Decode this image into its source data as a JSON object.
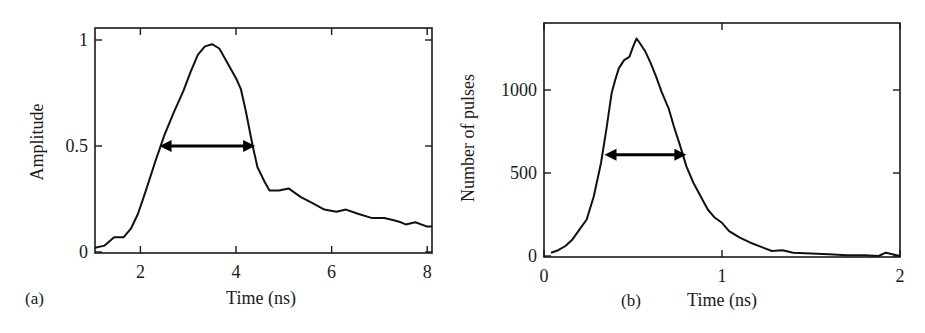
{
  "chart_data": [
    {
      "type": "line",
      "panel_label": "(a)",
      "title": "",
      "xlabel": "Time (ns)",
      "ylabel": "Amplitude",
      "xlim": [
        1.05,
        8.1
      ],
      "ylim": [
        0,
        1.05
      ],
      "xticks": [
        2,
        4,
        6,
        8
      ],
      "xtick_labels": [
        "2",
        "4",
        "6",
        "8"
      ],
      "yticks": [
        0,
        0.5,
        1
      ],
      "ytick_labels": [
        "0",
        "0.5",
        "1"
      ],
      "grid": false,
      "legend": null,
      "annotations": [
        {
          "type": "double-arrow",
          "label": "FWHM",
          "x_start": 2.4,
          "x_end": 4.4,
          "y": 0.5
        }
      ],
      "series": [
        {
          "name": "Amplitude",
          "x": [
            1.05,
            1.25,
            1.45,
            1.65,
            1.8,
            1.95,
            2.1,
            2.3,
            2.5,
            2.7,
            2.9,
            3.05,
            3.2,
            3.35,
            3.5,
            3.65,
            3.8,
            4.0,
            4.1,
            4.2,
            4.35,
            4.45,
            4.6,
            4.7,
            4.9,
            5.1,
            5.35,
            5.6,
            5.85,
            6.1,
            6.3,
            6.55,
            6.85,
            7.1,
            7.3,
            7.45,
            7.55,
            7.75,
            8.0,
            8.1
          ],
          "values": [
            0.02,
            0.03,
            0.07,
            0.07,
            0.11,
            0.18,
            0.28,
            0.42,
            0.55,
            0.66,
            0.76,
            0.85,
            0.93,
            0.97,
            0.98,
            0.96,
            0.9,
            0.82,
            0.77,
            0.67,
            0.5,
            0.4,
            0.33,
            0.29,
            0.29,
            0.3,
            0.26,
            0.23,
            0.2,
            0.19,
            0.2,
            0.18,
            0.16,
            0.16,
            0.15,
            0.14,
            0.13,
            0.14,
            0.12,
            0.12
          ]
        }
      ]
    },
    {
      "type": "line",
      "panel_label": "(b)",
      "title": "",
      "xlabel": "Time (ns)",
      "ylabel": "Number of pulses",
      "xlim": [
        0,
        2
      ],
      "ylim": [
        0,
        1400
      ],
      "xticks": [
        0,
        1,
        2
      ],
      "xtick_labels": [
        "0",
        "1",
        "2"
      ],
      "yticks": [
        0,
        500,
        1000
      ],
      "ytick_labels": [
        "0",
        "500",
        "1000"
      ],
      "grid": false,
      "legend": null,
      "annotations": [
        {
          "type": "double-arrow",
          "label": "FWHM",
          "x_start": 0.34,
          "x_end": 0.8,
          "y": 610
        }
      ],
      "series": [
        {
          "name": "Number of pulses",
          "x": [
            0.04,
            0.08,
            0.12,
            0.16,
            0.2,
            0.24,
            0.28,
            0.32,
            0.35,
            0.38,
            0.4,
            0.42,
            0.45,
            0.48,
            0.5,
            0.52,
            0.54,
            0.57,
            0.6,
            0.63,
            0.66,
            0.7,
            0.73,
            0.76,
            0.8,
            0.84,
            0.88,
            0.92,
            0.96,
            1.0,
            1.04,
            1.1,
            1.16,
            1.22,
            1.28,
            1.34,
            1.4,
            1.5,
            1.6,
            1.7,
            1.8,
            1.88,
            1.92,
            2.0
          ],
          "values": [
            20,
            35,
            60,
            100,
            160,
            220,
            360,
            560,
            760,
            980,
            1060,
            1130,
            1180,
            1200,
            1260,
            1310,
            1280,
            1230,
            1160,
            1080,
            990,
            890,
            780,
            680,
            540,
            440,
            360,
            280,
            230,
            200,
            150,
            110,
            80,
            55,
            30,
            35,
            20,
            15,
            10,
            5,
            5,
            0,
            20,
            0
          ]
        }
      ]
    }
  ]
}
